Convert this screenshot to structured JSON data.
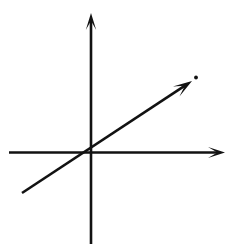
{
  "figure": {
    "title": "Cartesian coordinate axes with a diagonal line through the origin",
    "type": "line-diagram",
    "background_color": "#ffffff",
    "stroke_color": "#121212",
    "canvas": {
      "width": 235,
      "height": 249
    },
    "origin": {
      "x": 91,
      "y": 152.5
    }
  },
  "chart_data": {
    "type": "line",
    "title": "",
    "xlabel": "",
    "ylabel": "",
    "grid": false,
    "legend": null,
    "axes": {
      "x_axis": {
        "label": "",
        "start": {
          "x": 9,
          "y": 152.5
        },
        "end": {
          "x": 225,
          "y": 152.5
        },
        "arrow_at": "end",
        "stroke_width": 2.6
      },
      "y_axis": {
        "label": "",
        "start": {
          "x": 91,
          "y": 244
        },
        "end": {
          "x": 91,
          "y": 13
        },
        "arrow_at": "end",
        "stroke_width": 2.6
      }
    },
    "series": [
      {
        "name": "diagonal-ray",
        "points": [
          {
            "x": 22,
            "y": 193
          },
          {
            "x": 192,
            "y": 81
          }
        ],
        "slope_screen": -0.66,
        "passes_through_origin": true,
        "arrow_at": "end",
        "stroke_width": 2.6
      }
    ],
    "marks": [
      {
        "name": "speck",
        "x": 196,
        "y": 77.5,
        "r": 1.9
      }
    ]
  },
  "elements": {
    "x_axis_name": "x-axis",
    "y_axis_name": "y-axis",
    "diagonal_name": "diagonal line",
    "origin_name": "origin",
    "speck_name": "ink speck"
  }
}
